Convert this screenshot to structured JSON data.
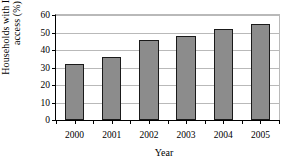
{
  "chart_data": {
    "type": "bar",
    "title": "",
    "xlabel": "Year",
    "ylabel_line1": "Households with Internet",
    "ylabel_line2": "access (%)",
    "categories": [
      "2000",
      "2001",
      "2002",
      "2003",
      "2004",
      "2005"
    ],
    "values": [
      32,
      36,
      46,
      48,
      52,
      55
    ],
    "series": [
      {
        "name": "Households with Internet access (%)",
        "values": [
          32,
          36,
          46,
          48,
          52,
          55
        ]
      }
    ],
    "ylim": [
      0,
      60
    ],
    "yticks": [
      "0",
      "10",
      "20",
      "30",
      "40",
      "50",
      "60"
    ],
    "ytick_values": [
      0,
      10,
      20,
      30,
      40,
      50,
      60
    ],
    "grid": true,
    "grid_axis": "y",
    "legend": false,
    "legend_position": "none",
    "bar_color": "#8c8c8c",
    "bar_edge_color": "#1a1a1a",
    "grid_color": "#b9b9b9",
    "axis_color": "#000000",
    "background": "#ffffff"
  }
}
